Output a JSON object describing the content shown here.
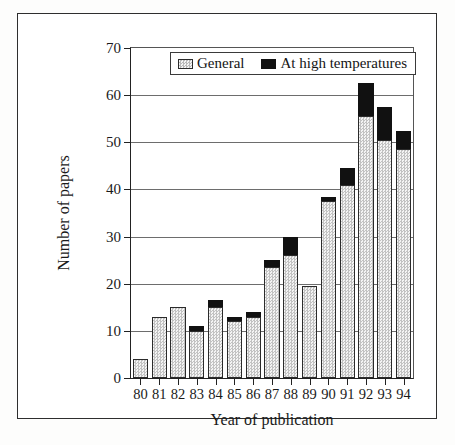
{
  "chart_data": {
    "type": "bar",
    "subtype": "stacked-vertical",
    "title": "",
    "xlabel": "Year of publication",
    "ylabel": "Number of papers",
    "categories": [
      "80",
      "81",
      "82",
      "83",
      "84",
      "85",
      "86",
      "87",
      "88",
      "89",
      "90",
      "91",
      "92",
      "93",
      "94"
    ],
    "series": [
      {
        "name": "General",
        "values": [
          4,
          13,
          15,
          10,
          15,
          12,
          13,
          23.5,
          26,
          19.5,
          37.5,
          41,
          55.5,
          50.5,
          48.5
        ]
      },
      {
        "name": "At high temperatures",
        "values": [
          0,
          0,
          0,
          1,
          1.5,
          1,
          1,
          1.5,
          4,
          0,
          1,
          3.5,
          7,
          7,
          4
        ]
      }
    ],
    "totals": [
      4,
      13,
      15,
      11,
      16.5,
      13,
      14,
      25,
      30,
      19.5,
      38.5,
      44.5,
      62.5,
      57.5,
      52.5
    ],
    "ylim": [
      0,
      70
    ],
    "ytick_values": [
      0,
      10,
      20,
      30,
      40,
      50,
      60,
      70
    ],
    "ytick_labels": [
      "0",
      "10",
      "20",
      "30",
      "40",
      "50",
      "60",
      "70"
    ],
    "grid": "horizontal",
    "legend_position": "top-center-inside",
    "colors": {
      "general": "#dcdcdc",
      "general_border": "#2b2b2b",
      "high_temperature": "#111111",
      "axis": "#222222",
      "gridline": "#6d6d6d",
      "frame": "#2e2e2e",
      "background": "#ffffff"
    }
  },
  "legend": {
    "entries": [
      {
        "label": "General",
        "swatch": "pattern-gray-swatch"
      },
      {
        "label": "At high temperatures",
        "swatch": "solid-black-swatch"
      }
    ]
  },
  "axes": {
    "y_title": "Number of papers",
    "x_title": "Year of publication"
  }
}
